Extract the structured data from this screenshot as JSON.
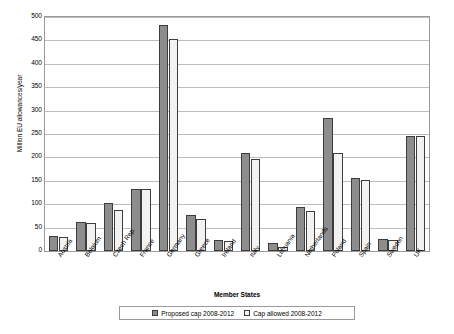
{
  "chart_data": {
    "type": "bar",
    "title": "",
    "xlabel": "Member States",
    "ylabel": "Million EU allowances/year",
    "ylim": [
      0,
      500
    ],
    "yticks": [
      0,
      50,
      100,
      150,
      200,
      250,
      300,
      350,
      400,
      450,
      500
    ],
    "ytick_labels": [
      "0",
      "50",
      "100",
      "150",
      "200",
      "250",
      "300",
      "350",
      "400",
      "450",
      "500"
    ],
    "grid": true,
    "legend_position": "bottom",
    "categories": [
      "Austria",
      "Belgium",
      "Czech Rep.",
      "France",
      "Germany",
      "Greece",
      "Ireland",
      "Italy",
      "Lithuania",
      "Netherlands",
      "Poland",
      "Spain",
      "Sweden",
      "UK"
    ],
    "series": [
      {
        "name": "Proposed cap 2008-2012",
        "color": "#8d8d8d",
        "values": [
          33,
          63,
          102,
          133,
          482,
          76,
          23,
          209,
          17,
          95,
          285,
          155,
          26,
          246
        ]
      },
      {
        "name": "Cap allowed 2008-2012",
        "color": "#f2f2f2",
        "values": [
          31,
          59,
          87,
          133,
          453,
          69,
          22,
          196,
          8,
          86,
          209,
          152,
          23,
          246
        ]
      }
    ]
  },
  "legend": {
    "items": [
      {
        "label": "Proposed cap 2008-2012"
      },
      {
        "label": "Cap allowed 2008-2012"
      }
    ]
  }
}
